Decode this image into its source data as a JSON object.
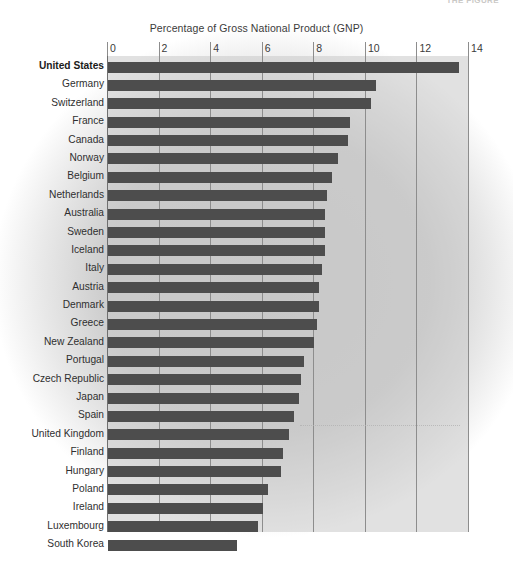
{
  "page": {
    "header_fragment": "THE FIGURE"
  },
  "chart_data": {
    "type": "bar",
    "orientation": "horizontal",
    "title": "Percentage of Gross National Product (GNP)",
    "xlabel": "",
    "ylabel": "",
    "xlim": [
      0,
      14
    ],
    "xticks": [
      0,
      2,
      4,
      6,
      8,
      10,
      12,
      14
    ],
    "grid": true,
    "legend": "none",
    "bar_color": "#4d4d4d",
    "plot_background": "#c8c8c8",
    "highlight_category": "United States",
    "categories": [
      "United States",
      "Germany",
      "Switzerland",
      "France",
      "Canada",
      "Norway",
      "Belgium",
      "Netherlands",
      "Australia",
      "Sweden",
      "Iceland",
      "Italy",
      "Austria",
      "Denmark",
      "Greece",
      "New Zealand",
      "Portugal",
      "Czech Republic",
      "Japan",
      "Spain",
      "United Kingdom",
      "Finland",
      "Hungary",
      "Poland",
      "Ireland",
      "Luxembourg",
      "South Korea"
    ],
    "values": [
      13.6,
      10.4,
      10.2,
      9.4,
      9.3,
      8.9,
      8.7,
      8.5,
      8.4,
      8.4,
      8.4,
      8.3,
      8.2,
      8.2,
      8.1,
      8.0,
      7.6,
      7.5,
      7.4,
      7.2,
      7.0,
      6.8,
      6.7,
      6.2,
      6.0,
      5.8,
      5.0
    ]
  }
}
